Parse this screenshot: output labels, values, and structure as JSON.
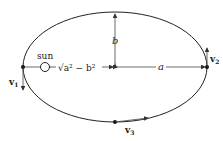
{
  "diagram": {
    "labels": {
      "sun": "sun",
      "focal_distance": "√a² − b²",
      "semi_major": "a",
      "semi_minor": "b",
      "v1": "v",
      "v1_sub": "1",
      "v2": "v",
      "v2_sub": "2",
      "v3": "v",
      "v3_sub": "3"
    },
    "colors": {
      "stroke": "#222222",
      "background": "#ffffff"
    }
  }
}
